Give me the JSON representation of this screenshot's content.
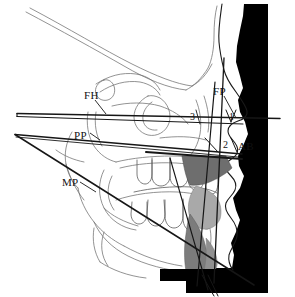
{
  "image": {
    "kind": "lateral-cephalometric-tracing",
    "width": 295,
    "height": 297,
    "background_color": "#ffffff",
    "silhouette_color": "#000000",
    "tracing_line_color": "#555555",
    "reference_line_color": "#1a1a1a",
    "soft_tissue_shade_dark": "#6b6b6b",
    "soft_tissue_shade_light": "#a8a8a8"
  },
  "labels": [
    {
      "id": "fh",
      "text": "FH",
      "x": 84,
      "y": 96,
      "meaning": "frankfort-horizontal-plane"
    },
    {
      "id": "pp",
      "text": "PP",
      "x": 76,
      "y": 136,
      "meaning": "palatal-plane"
    },
    {
      "id": "mp",
      "text": "MP",
      "x": 64,
      "y": 183,
      "meaning": "mandibular-plane"
    },
    {
      "id": "fp",
      "text": "FP",
      "x": 216,
      "y": 92,
      "meaning": "facial-plane"
    },
    {
      "id": "ab",
      "text": "AB",
      "x": 240,
      "y": 147,
      "meaning": "ab-plane"
    },
    {
      "id": "n3",
      "text": "3",
      "x": 192,
      "y": 118,
      "meaning": "angle-marker-3"
    },
    {
      "id": "n2",
      "text": "2",
      "x": 224,
      "y": 146,
      "meaning": "angle-marker-2"
    },
    {
      "id": "n1",
      "text": "1",
      "x": 230,
      "y": 117,
      "meaning": "angle-marker-1"
    }
  ],
  "reference_lines": [
    {
      "id": "fh-plane",
      "name": "frankfort-horizontal",
      "x1": 18,
      "y1": 114,
      "x2": 278,
      "y2": 118
    },
    {
      "id": "fh-plane-2",
      "name": "frankfort-horizontal-lower",
      "x1": 18,
      "y1": 117,
      "x2": 240,
      "y2": 124
    },
    {
      "id": "pp-plane",
      "name": "palatal-plane",
      "x1": 15,
      "y1": 135,
      "x2": 238,
      "y2": 154
    },
    {
      "id": "mp-plane",
      "name": "mandibular-plane",
      "x1": 15,
      "y1": 135,
      "x2": 252,
      "y2": 283
    },
    {
      "id": "fp-plane",
      "name": "facial-plane",
      "x1": 223,
      "y1": 59,
      "x2": 215,
      "y2": 281
    },
    {
      "id": "ab-plane",
      "name": "ab-plane-line",
      "x1": 214,
      "y1": 83,
      "x2": 198,
      "y2": 284
    },
    {
      "id": "occ-plane",
      "name": "occlusal-plane",
      "x1": 150,
      "y1": 152,
      "x2": 240,
      "y2": 160
    },
    {
      "id": "incisor-axis",
      "name": "incisor-long-axis",
      "x1": 171,
      "y1": 159,
      "x2": 206,
      "y2": 288
    }
  ],
  "structures": [
    {
      "id": "profile-silhouette",
      "name": "soft-tissue-profile-silhouette"
    },
    {
      "id": "cranial-base",
      "name": "cranial-base-tracing"
    },
    {
      "id": "orbit",
      "name": "orbital-outline"
    },
    {
      "id": "maxilla",
      "name": "maxilla-outline"
    },
    {
      "id": "mandible",
      "name": "mandible-outline"
    },
    {
      "id": "teeth",
      "name": "dentition-tracing"
    },
    {
      "id": "upper-lip",
      "name": "upper-lip-shade"
    },
    {
      "id": "lower-lip",
      "name": "lower-lip-shade"
    },
    {
      "id": "chin-pad",
      "name": "chin-soft-tissue-shade"
    },
    {
      "id": "tongue",
      "name": "tongue-outline"
    },
    {
      "id": "nasal-bone",
      "name": "nasal-bone-outline"
    },
    {
      "id": "sella",
      "name": "sella-turcica"
    }
  ]
}
